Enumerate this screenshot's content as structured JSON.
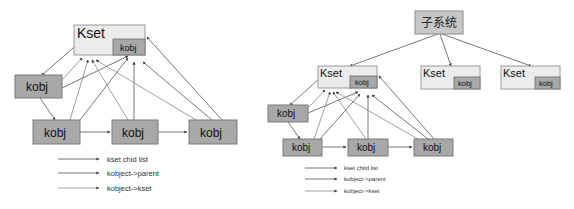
{
  "left_diagram": {
    "kset": {
      "label": "Kset",
      "inner_label": "kobj"
    },
    "kobjs": [
      "kobj",
      "kobj",
      "kobj",
      "kobj"
    ],
    "legend": [
      {
        "label": "kset chid list"
      },
      {
        "label": "kobject->parent"
      },
      {
        "label": "kobject->kset"
      }
    ]
  },
  "right_diagram": {
    "subsystem": {
      "label": "子系统"
    },
    "ksets": [
      {
        "label": "Kset",
        "inner_label": "kobj"
      },
      {
        "label": "Kset",
        "inner_label": "kobj"
      },
      {
        "label": "Kset",
        "inner_label": "kobj"
      }
    ],
    "kobjs": [
      "kobj",
      "kobj",
      "kobj",
      "kobj"
    ],
    "legend": [
      {
        "label": "kset child list"
      },
      {
        "label": "kobject->parent"
      },
      {
        "label": "kobject->kset"
      }
    ]
  },
  "colors": {
    "kset_fill": "#ececec",
    "kobj_fill": "#a8a8a8",
    "subsystem_fill": "#c8c8c8",
    "edge": "#555555"
  }
}
